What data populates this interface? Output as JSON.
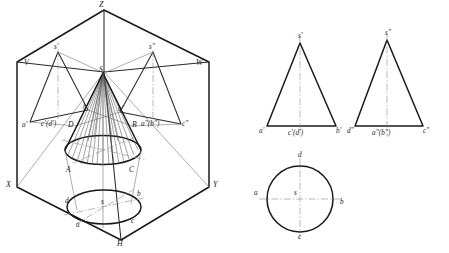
{
  "figure": {
    "type": "engineering-orthographic-projection-drawing",
    "background_color": "#ffffff",
    "line_color": "#1a1a1a",
    "thin_line_color": "#6e6e6e",
    "centerline_color": "#7a7a7a"
  },
  "isometric_view": {
    "name": "three-plane projection box with cone",
    "plane_labels": {
      "V": "V",
      "W": "W",
      "H": "H",
      "X": "X",
      "Y": "Y",
      "Z": "Z"
    },
    "cone_labels": {
      "apex": "S",
      "point_a": "A",
      "point_b": "B",
      "point_c": "C",
      "point_d": "D"
    },
    "front_projection_labels": {
      "apex": "s'",
      "left": "a'",
      "mid": "c'(d')",
      "right": "b'"
    },
    "side_projection_labels": {
      "apex": "s\"",
      "left": "a\"(b\")",
      "right": "c\""
    },
    "top_projection_labels": {
      "center": "s",
      "front": "a",
      "right": "b",
      "rear_right": "c",
      "left": "d"
    }
  },
  "front_view": {
    "name": "front-view-V-projection",
    "apex_label": "s'",
    "base_left_label": "a'",
    "base_center_label": "c'(d')",
    "base_right_label": "b'"
  },
  "side_view": {
    "name": "side-view-W-projection",
    "apex_label": "s\"",
    "base_left_label": "d\"",
    "base_center_label": "a\"(b\")",
    "base_right_label": "c\""
  },
  "top_view": {
    "name": "top-view-H-projection-circle",
    "center_label": "s",
    "top_label": "d",
    "right_label": "b",
    "bottom_label": "c",
    "left_label": "a"
  }
}
